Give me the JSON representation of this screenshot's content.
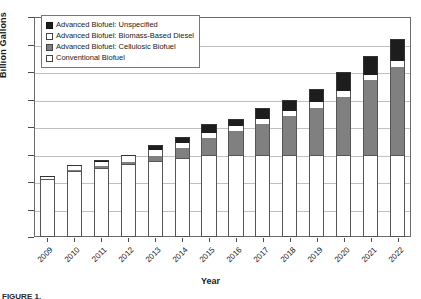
{
  "chart_data": {
    "type": "bar",
    "stacked": true,
    "title": "",
    "xlabel": "Year",
    "ylabel": "Billion Gallons",
    "ylim": [
      0,
      40
    ],
    "ytick_step": 5,
    "yticks": [
      "0",
      "5",
      "10",
      "15",
      "20",
      "25",
      "30",
      "35",
      "40"
    ],
    "grid": true,
    "legend_position": "top-left",
    "categories": [
      "2009",
      "2010",
      "2011",
      "2012",
      "2013",
      "2014",
      "2015",
      "2016",
      "2017",
      "2018",
      "2019",
      "2020",
      "2021",
      "2022"
    ],
    "series": [
      {
        "name": "Conventional Biofuel",
        "color": "#ffffff",
        "values": [
          10.5,
          12.0,
          12.6,
          13.2,
          13.8,
          14.4,
          15.0,
          15.0,
          15.0,
          15.0,
          15.0,
          15.0,
          15.0,
          15.0
        ]
      },
      {
        "name": "Advanced Biofuel: Cellulosic Biofuel",
        "color": "#808080",
        "values": [
          0.0,
          0.1,
          0.25,
          0.5,
          1.0,
          1.75,
          3.0,
          4.25,
          5.5,
          7.0,
          8.5,
          10.5,
          13.5,
          16.0
        ]
      },
      {
        "name": "Advanced Biofuel: Biomass-Based Diesel",
        "color": "#ffffff",
        "values": [
          0.5,
          0.65,
          0.8,
          1.0,
          1.0,
          1.0,
          1.0,
          1.0,
          1.0,
          1.0,
          1.0,
          1.0,
          1.0,
          1.0
        ]
      },
      {
        "name": "Advanced Biofuel: Unspecified",
        "color": "#1d1d1d",
        "values": [
          0.1,
          0.2,
          0.3,
          0.3,
          0.95,
          1.1,
          1.5,
          1.25,
          2.0,
          2.0,
          2.5,
          3.5,
          3.5,
          4.0
        ]
      }
    ],
    "totals": [
      11.1,
      12.95,
      13.95,
      15.2,
      16.55,
      18.15,
      20.5,
      21.5,
      23.5,
      25.0,
      27.0,
      30.0,
      33.0,
      36.0
    ]
  },
  "legend": {
    "items": [
      {
        "label": "Advanced Biofuel: Unspecified",
        "swatch": "black"
      },
      {
        "label": "Advanced Biofuel: Biomass-Based Diesel",
        "swatch": "white"
      },
      {
        "label": "Advanced Biofuel: Cellulosic Biofuel",
        "swatch": "gray"
      },
      {
        "label": "Conventional Biofuel",
        "swatch": "white"
      }
    ]
  },
  "caption_sliver": "FIGURE 1."
}
